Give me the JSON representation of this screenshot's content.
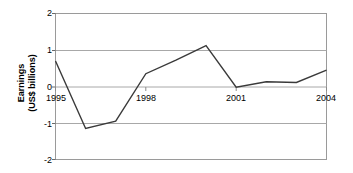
{
  "chart_data": {
    "type": "line",
    "title": "",
    "xlabel": "",
    "ylabel": "Earnings\n(US$ billions)",
    "ylabel_line1": "Earnings",
    "ylabel_line2": "(US$ billions)",
    "x": [
      1995,
      1996,
      1997,
      1998,
      1999,
      2000,
      2001,
      2002,
      2003,
      2004
    ],
    "values": [
      0.7,
      -1.15,
      -0.95,
      0.35,
      0.72,
      1.12,
      -0.02,
      0.13,
      0.11,
      0.45
    ],
    "series": [
      {
        "name": "Earnings",
        "values": [
          0.7,
          -1.15,
          -0.95,
          0.35,
          0.72,
          1.12,
          -0.02,
          0.13,
          0.11,
          0.45
        ]
      }
    ],
    "xlim": [
      1995,
      2004
    ],
    "ylim": [
      -2,
      2
    ],
    "yticks": [
      2,
      1,
      0,
      -1,
      -2
    ],
    "ytick_labels": [
      "2",
      "1",
      "0",
      "-1",
      "-2"
    ],
    "xticks": [
      1995,
      1998,
      2001,
      2004
    ],
    "xtick_labels": [
      "1995",
      "1998",
      "2001",
      "2004"
    ],
    "grid": true,
    "grid_axis": "y",
    "legend": false,
    "legend_position": "none",
    "line_color": "#3a3a3a",
    "grid_color": "#a8a8a8",
    "border_color": "#9a9a9a",
    "plot_background": "#ffffff"
  }
}
